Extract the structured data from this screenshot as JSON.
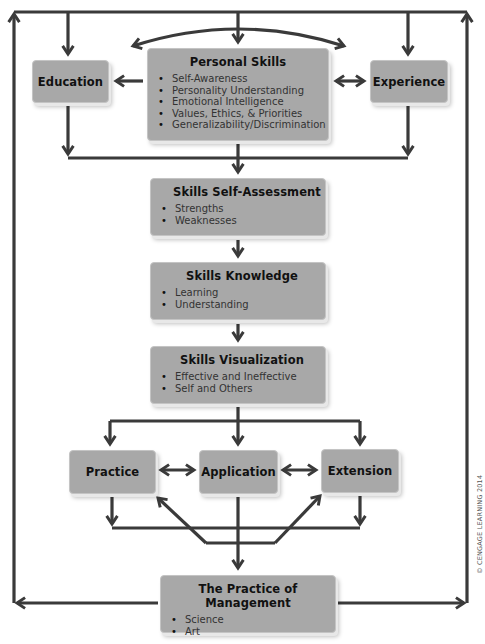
{
  "diagram": {
    "type": "flowchart",
    "colors": {
      "box_fill": "#a8a8a8",
      "line": "#3a3a3a",
      "text": "#111111",
      "background": "#ffffff"
    },
    "nodes": {
      "education": {
        "title": "Education"
      },
      "experience": {
        "title": "Experience"
      },
      "personal_skills": {
        "title": "Personal Skills",
        "items": [
          "Self-Awareness",
          "Personality Understanding",
          "Emotional Intelligence",
          "Values, Ethics, & Priorities",
          "Generalizability/Discrimination"
        ]
      },
      "self_assessment": {
        "title": "Skills Self-Assessment",
        "items": [
          "Strengths",
          "Weaknesses"
        ]
      },
      "knowledge": {
        "title": "Skills Knowledge",
        "items": [
          "Learning",
          "Understanding"
        ]
      },
      "visualization": {
        "title": "Skills Visualization",
        "items": [
          "Effective and Ineffective",
          "Self and Others"
        ]
      },
      "practice": {
        "title": "Practice"
      },
      "application": {
        "title": "Application"
      },
      "extension": {
        "title": "Extension"
      },
      "management": {
        "title": "The Practice of Management",
        "items": [
          "Science",
          "Art"
        ]
      }
    },
    "edges": [
      {
        "from": "outer-loop",
        "to": "education"
      },
      {
        "from": "outer-loop",
        "to": "personal_skills"
      },
      {
        "from": "outer-loop",
        "to": "experience"
      },
      {
        "from": "personal_skills",
        "to": "education"
      },
      {
        "from": "personal_skills",
        "to": "experience",
        "bidirectional": true
      },
      {
        "from": "personal_skills",
        "to": "education",
        "curved": true
      },
      {
        "from": "personal_skills",
        "to": "experience",
        "curved": true
      },
      {
        "from": "education",
        "to": "self_assessment"
      },
      {
        "from": "personal_skills",
        "to": "self_assessment"
      },
      {
        "from": "experience",
        "to": "self_assessment"
      },
      {
        "from": "self_assessment",
        "to": "knowledge"
      },
      {
        "from": "knowledge",
        "to": "visualization"
      },
      {
        "from": "visualization",
        "to": "practice"
      },
      {
        "from": "visualization",
        "to": "application"
      },
      {
        "from": "visualization",
        "to": "extension"
      },
      {
        "from": "practice",
        "to": "application",
        "bidirectional": true
      },
      {
        "from": "application",
        "to": "extension",
        "bidirectional": true
      },
      {
        "from": "application",
        "to": "management"
      },
      {
        "from": "application",
        "to": "practice",
        "diagonal": true
      },
      {
        "from": "application",
        "to": "extension",
        "diagonal": true
      },
      {
        "from": "management",
        "to": "outer-loop-left"
      },
      {
        "from": "management",
        "to": "outer-loop-right"
      }
    ]
  },
  "copyright": "© CENGAGE LEARNING 2014"
}
